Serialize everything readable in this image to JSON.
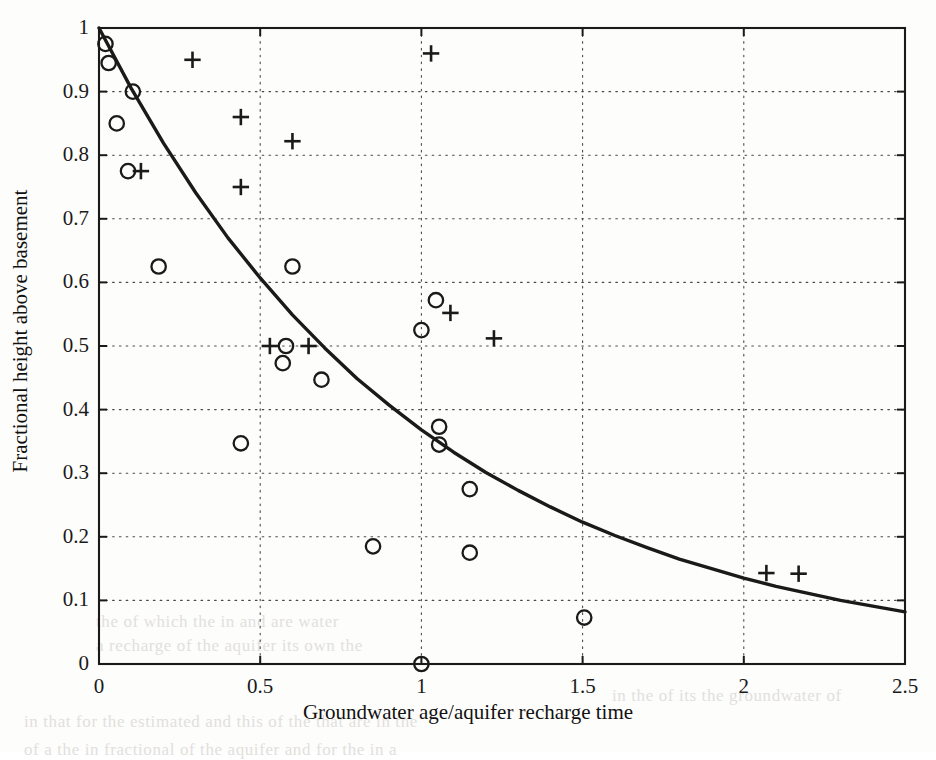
{
  "figure": {
    "background_color": "#fdfdfc",
    "ink_color": "#1a1a1a"
  },
  "bleed_through_lines": [
    {
      "text": "the  of  which  the  in  and  are  water",
      "x": 96,
      "y": 612
    },
    {
      "text": "a  recharge  of  the  aquifer  its  own  the",
      "x": 96,
      "y": 636
    },
    {
      "text": "in  the  of  its  the  groundwater  of",
      "x": 612,
      "y": 686
    },
    {
      "text": "in   that  for  the  estimated  and  this  of  the  that  are  in  the",
      "x": 24,
      "y": 712
    },
    {
      "text": "of  a  the  in  fractional  of  the  aquifer  and  for  the  in  a",
      "x": 24,
      "y": 740
    }
  ],
  "chart_data": {
    "type": "scatter",
    "title": "",
    "xlabel": "Groundwater age/aquifer recharge time",
    "ylabel": "Fractional height above basement",
    "xlim": [
      0,
      2.5
    ],
    "ylim": [
      0,
      1
    ],
    "xticks": [
      0,
      0.5,
      1,
      1.5,
      2,
      2.5
    ],
    "xtick_labels": [
      "0",
      "0.5",
      "1",
      "1.5",
      "2",
      "2.5"
    ],
    "yticks": [
      0,
      0.1,
      0.2,
      0.3,
      0.4,
      0.5,
      0.6,
      0.7,
      0.8,
      0.9,
      1
    ],
    "ytick_labels": [
      "0",
      "0.1",
      "0.2",
      "0.3",
      "0.4",
      "0.5",
      "0.6",
      "0.7",
      "0.8",
      "0.9",
      "1"
    ],
    "grid": true,
    "grid_style": "dotted",
    "legend": "none",
    "series": [
      {
        "name": "circle-markers",
        "marker": "circle",
        "points": [
          [
            0.02,
            0.975
          ],
          [
            0.03,
            0.945
          ],
          [
            0.105,
            0.9
          ],
          [
            0.055,
            0.85
          ],
          [
            0.09,
            0.775
          ],
          [
            0.185,
            0.625
          ],
          [
            0.6,
            0.625
          ],
          [
            1.045,
            0.572
          ],
          [
            1.0,
            0.525
          ],
          [
            0.58,
            0.5
          ],
          [
            0.57,
            0.473
          ],
          [
            0.69,
            0.447
          ],
          [
            0.44,
            0.347
          ],
          [
            1.055,
            0.373
          ],
          [
            1.055,
            0.345
          ],
          [
            1.15,
            0.275
          ],
          [
            0.85,
            0.185
          ],
          [
            1.15,
            0.175
          ],
          [
            1.505,
            0.073
          ],
          [
            1.0,
            0.0
          ]
        ]
      },
      {
        "name": "plus-markers",
        "marker": "plus",
        "points": [
          [
            0.29,
            0.95
          ],
          [
            1.03,
            0.96
          ],
          [
            0.44,
            0.86
          ],
          [
            0.6,
            0.822
          ],
          [
            0.13,
            0.775
          ],
          [
            0.44,
            0.75
          ],
          [
            1.09,
            0.552
          ],
          [
            1.225,
            0.512
          ],
          [
            0.53,
            0.5
          ],
          [
            0.65,
            0.5
          ],
          [
            2.07,
            0.143
          ],
          [
            2.17,
            0.142
          ]
        ]
      }
    ],
    "fit_curve": {
      "name": "exponential-decay-fit",
      "expression": "y = exp(-x)",
      "x_start": 0,
      "x_end": 2.5,
      "points": [
        [
          0.0,
          1.0
        ],
        [
          0.1,
          0.905
        ],
        [
          0.2,
          0.819
        ],
        [
          0.3,
          0.741
        ],
        [
          0.4,
          0.67
        ],
        [
          0.5,
          0.607
        ],
        [
          0.6,
          0.549
        ],
        [
          0.7,
          0.497
        ],
        [
          0.8,
          0.449
        ],
        [
          0.9,
          0.407
        ],
        [
          1.0,
          0.368
        ],
        [
          1.1,
          0.333
        ],
        [
          1.2,
          0.301
        ],
        [
          1.3,
          0.273
        ],
        [
          1.4,
          0.247
        ],
        [
          1.5,
          0.223
        ],
        [
          1.6,
          0.202
        ],
        [
          1.7,
          0.183
        ],
        [
          1.8,
          0.165
        ],
        [
          1.9,
          0.15
        ],
        [
          2.0,
          0.135
        ],
        [
          2.1,
          0.122
        ],
        [
          2.2,
          0.111
        ],
        [
          2.3,
          0.1
        ],
        [
          2.4,
          0.091
        ],
        [
          2.5,
          0.082
        ]
      ]
    }
  }
}
